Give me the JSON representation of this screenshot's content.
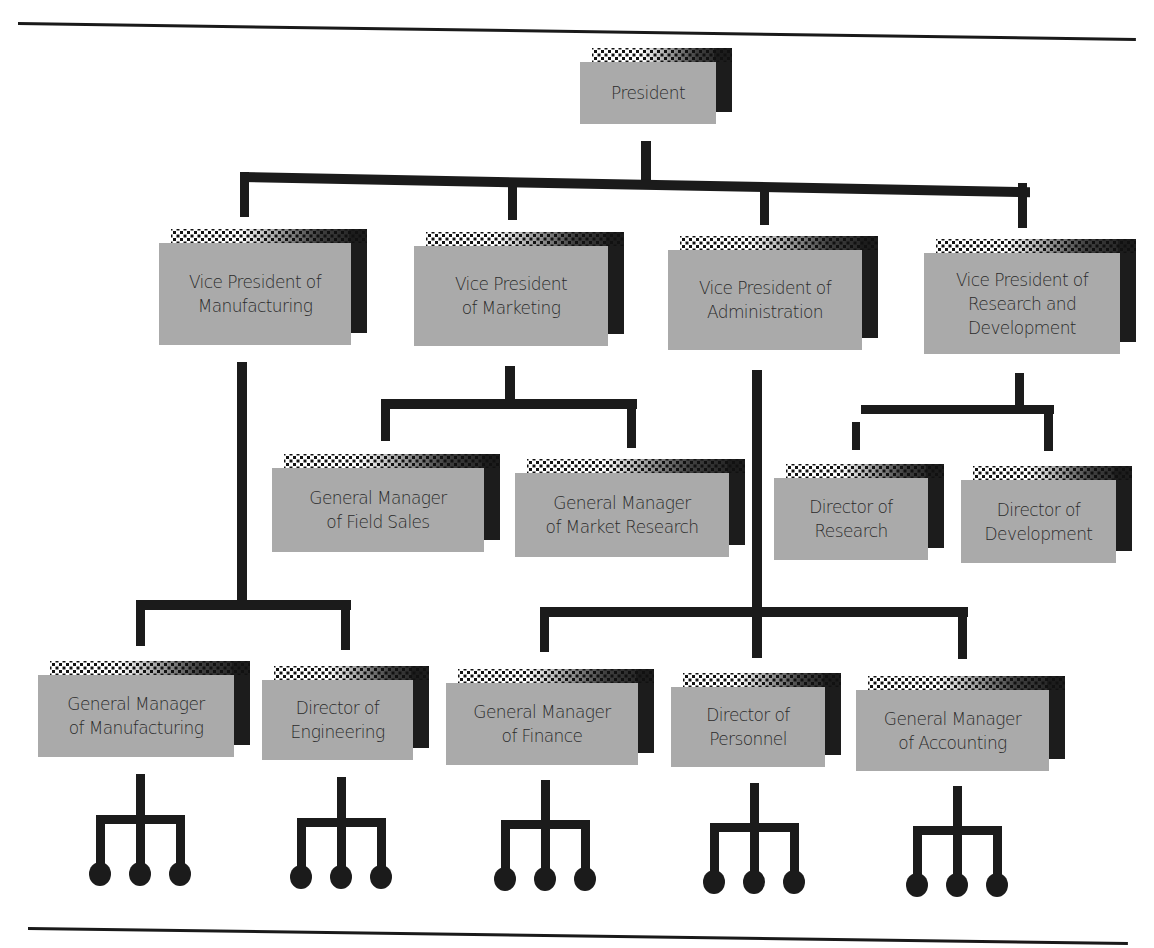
{
  "chart": {
    "title": "",
    "rules": [
      {
        "name": "top-rule",
        "x1": 18,
        "y1": 22,
        "x2": 1136,
        "y2": 38
      },
      {
        "name": "bottom-rule",
        "x1": 28,
        "y1": 927,
        "x2": 1128,
        "y2": 942
      }
    ],
    "nodes": [
      {
        "id": "president",
        "label": "President",
        "x": 580,
        "y": 62,
        "w": 136,
        "h": 62
      },
      {
        "id": "vp-manufacturing",
        "label": "Vice President of\nManufacturing",
        "x": 159,
        "y": 243,
        "w": 192,
        "h": 102
      },
      {
        "id": "vp-marketing",
        "label": "Vice President\nof Marketing",
        "x": 414,
        "y": 246,
        "w": 194,
        "h": 100
      },
      {
        "id": "vp-administration",
        "label": "Vice President of\nAdministration",
        "x": 668,
        "y": 250,
        "w": 194,
        "h": 100
      },
      {
        "id": "vp-research-development",
        "label": "Vice President of\nResearch and\nDevelopment",
        "x": 924,
        "y": 253,
        "w": 196,
        "h": 101
      },
      {
        "id": "gm-field-sales",
        "label": "General Manager\nof Field Sales",
        "x": 272,
        "y": 468,
        "w": 212,
        "h": 84
      },
      {
        "id": "gm-market-research",
        "label": "General Manager\nof Market Research",
        "x": 515,
        "y": 473,
        "w": 214,
        "h": 84
      },
      {
        "id": "dir-research",
        "label": "Director of\nResearch",
        "x": 774,
        "y": 478,
        "w": 154,
        "h": 82
      },
      {
        "id": "dir-development",
        "label": "Director of\nDevelopment",
        "x": 961,
        "y": 480,
        "w": 155,
        "h": 83
      },
      {
        "id": "gm-manufacturing",
        "label": "General Manager\nof Manufacturing",
        "x": 38,
        "y": 675,
        "w": 196,
        "h": 82
      },
      {
        "id": "dir-engineering",
        "label": "Director of\nEngineering",
        "x": 262,
        "y": 680,
        "w": 151,
        "h": 80
      },
      {
        "id": "gm-finance",
        "label": "General Manager\nof Finance",
        "x": 446,
        "y": 683,
        "w": 192,
        "h": 82
      },
      {
        "id": "dir-personnel",
        "label": "Director of\nPersonnel",
        "x": 671,
        "y": 687,
        "w": 154,
        "h": 80
      },
      {
        "id": "gm-accounting",
        "label": "General Manager\nof Accounting",
        "x": 856,
        "y": 690,
        "w": 193,
        "h": 81
      }
    ],
    "connectors": [
      {
        "x": 641,
        "y": 141,
        "w": 10,
        "h": 40
      },
      {
        "x": 240,
        "y": 172,
        "w": 790,
        "h": 10,
        "skewY": 1.1
      },
      {
        "x": 240,
        "y": 172,
        "w": 9,
        "h": 45
      },
      {
        "x": 508,
        "y": 180,
        "w": 9,
        "h": 40
      },
      {
        "x": 760,
        "y": 185,
        "w": 9,
        "h": 40
      },
      {
        "x": 1018,
        "y": 183,
        "w": 9,
        "h": 45
      },
      {
        "x": 237,
        "y": 362,
        "w": 10,
        "h": 245
      },
      {
        "x": 136,
        "y": 600,
        "w": 215,
        "h": 10
      },
      {
        "x": 136,
        "y": 600,
        "w": 9,
        "h": 46
      },
      {
        "x": 341,
        "y": 604,
        "w": 9,
        "h": 46
      },
      {
        "x": 505,
        "y": 366,
        "w": 10,
        "h": 38
      },
      {
        "x": 381,
        "y": 399,
        "w": 256,
        "h": 10
      },
      {
        "x": 381,
        "y": 399,
        "w": 9,
        "h": 42
      },
      {
        "x": 627,
        "y": 403,
        "w": 9,
        "h": 45
      },
      {
        "x": 752,
        "y": 370,
        "w": 10,
        "h": 288
      },
      {
        "x": 540,
        "y": 607,
        "w": 428,
        "h": 10
      },
      {
        "x": 540,
        "y": 607,
        "w": 9,
        "h": 45
      },
      {
        "x": 752,
        "y": 607,
        "w": 9,
        "h": 50
      },
      {
        "x": 958,
        "y": 614,
        "w": 9,
        "h": 45
      },
      {
        "x": 1015,
        "y": 373,
        "w": 9,
        "h": 40
      },
      {
        "x": 861,
        "y": 405,
        "w": 193,
        "h": 9
      },
      {
        "x": 1044,
        "y": 405,
        "w": 9,
        "h": 46
      },
      {
        "x": 852,
        "y": 422,
        "w": 8,
        "h": 28
      }
    ],
    "subtrees": [
      {
        "cx": 140,
        "top": 774,
        "bar_y": 815,
        "dots_y": 864,
        "spread": 40
      },
      {
        "cx": 341,
        "top": 777,
        "bar_y": 818,
        "dots_y": 867,
        "spread": 40
      },
      {
        "cx": 545,
        "top": 780,
        "bar_y": 820,
        "dots_y": 869,
        "spread": 40
      },
      {
        "cx": 754,
        "top": 783,
        "bar_y": 823,
        "dots_y": 872,
        "spread": 40
      },
      {
        "cx": 957,
        "top": 786,
        "bar_y": 826,
        "dots_y": 875,
        "spread": 40
      }
    ],
    "colors": {
      "box_face": "#aaaaaa",
      "box_shadow": "#1c1c1c",
      "line": "#1b1b1b",
      "text": "#2a2a2a",
      "background": "#ffffff"
    }
  }
}
